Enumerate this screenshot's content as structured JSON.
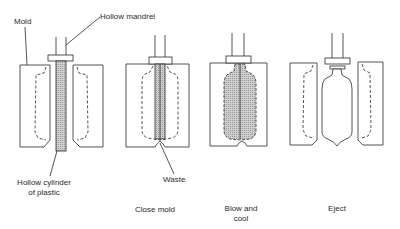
{
  "diagram": {
    "labels": {
      "mold": "Mold",
      "hollow_mandrel": "Hollow mandrel",
      "parison_line1": "Hollow cylinder",
      "parison_line2": "of plastic",
      "waste": "Waste"
    },
    "steps": [
      {
        "id": "step-1-parison",
        "caption": ""
      },
      {
        "id": "step-2-close-mold",
        "caption": "Close mold"
      },
      {
        "id": "step-3-blow-and-cool",
        "caption_line1": "Blow and",
        "caption_line2": "cool"
      },
      {
        "id": "step-4-eject",
        "caption": "Eject"
      }
    ],
    "colors": {
      "line": "#2a2a2a",
      "fill_plastic": "#c8c8c8",
      "background": "#ffffff"
    }
  }
}
